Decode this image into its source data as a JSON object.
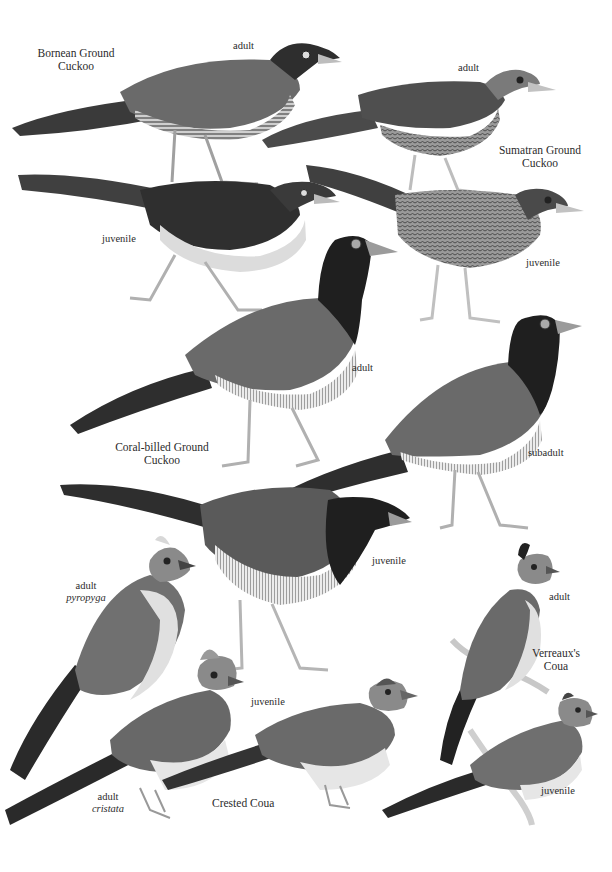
{
  "plate": {
    "background": "#ffffff",
    "tones": {
      "dark": "#2e2e2e",
      "mid": "#6f6f6f",
      "light": "#a9a9a9",
      "pale": "#d8d8d8"
    }
  },
  "species": [
    {
      "name_line1": "Bornean Ground",
      "name_line2": "Cuckoo",
      "figures": [
        {
          "label": "adult"
        },
        {
          "label": "juvenile"
        }
      ]
    },
    {
      "name_line1": "Sumatran Ground",
      "name_line2": "Cuckoo",
      "figures": [
        {
          "label": "adult"
        },
        {
          "label": "juvenile"
        }
      ]
    },
    {
      "name_line1": "Coral-billed Ground",
      "name_line2": "Cuckoo",
      "figures": [
        {
          "label": "adult"
        },
        {
          "label": "subadult"
        },
        {
          "label": "juvenile"
        }
      ]
    },
    {
      "name_line1": "Crested Coua",
      "name_line2": "",
      "figures": [
        {
          "label": "adult",
          "subspecies": "pyropyga"
        },
        {
          "label": "adult",
          "subspecies": "cristata"
        },
        {
          "label": "juvenile"
        }
      ]
    },
    {
      "name_line1": "Verreaux's",
      "name_line2": "Coua",
      "figures": [
        {
          "label": "adult"
        },
        {
          "label": "juvenile"
        }
      ]
    }
  ]
}
